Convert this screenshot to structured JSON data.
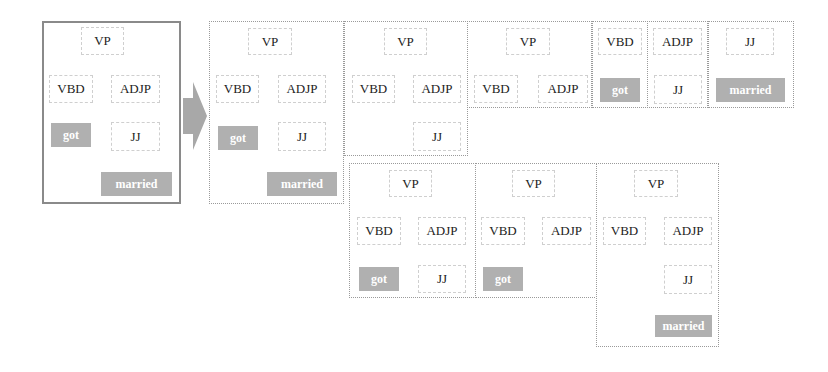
{
  "diagram": {
    "source_tree": {
      "root": "VP",
      "children": [
        "VBD",
        "ADJP"
      ],
      "VBD_child": "got",
      "ADJP_child": "JJ",
      "JJ_child": "married"
    },
    "labels": {
      "vp": "VP",
      "vbd": "VBD",
      "adjp": "ADJP",
      "jj": "JJ",
      "got": "got",
      "married": "married"
    },
    "colors": {
      "leaf_fill": "#b0b0b0",
      "leaf_text": "#ffffff",
      "node_border": "#cfcfcf",
      "panel_border": "#9a9a9a",
      "arrow": "#a8a8a8"
    },
    "fragments": [
      {
        "id": 1,
        "nodes": [
          "VP",
          "VBD",
          "ADJP",
          "got",
          "JJ",
          "married"
        ]
      },
      {
        "id": 2,
        "nodes": [
          "VP",
          "VBD",
          "ADJP",
          "JJ"
        ]
      },
      {
        "id": 3,
        "nodes": [
          "VP",
          "VBD",
          "ADJP"
        ]
      },
      {
        "id": 4,
        "nodes": [
          "VBD",
          "got"
        ]
      },
      {
        "id": 5,
        "nodes": [
          "ADJP",
          "JJ"
        ]
      },
      {
        "id": 6,
        "nodes": [
          "JJ",
          "married"
        ]
      },
      {
        "id": 7,
        "nodes": [
          "VP",
          "VBD",
          "ADJP",
          "got",
          "JJ"
        ]
      },
      {
        "id": 8,
        "nodes": [
          "VP",
          "VBD",
          "ADJP",
          "got"
        ]
      },
      {
        "id": 9,
        "nodes": [
          "VP",
          "VBD",
          "ADJP",
          "JJ",
          "married"
        ]
      }
    ]
  }
}
